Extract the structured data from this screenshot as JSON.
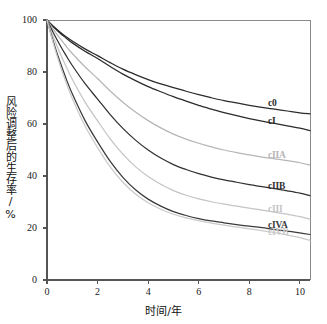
{
  "chart_data": {
    "type": "line",
    "title": "",
    "xlabel": "时间/年",
    "ylabel": "风险调整后的生存率/%",
    "xlim": [
      0,
      10.4
    ],
    "ylim": [
      0,
      100
    ],
    "xticks": [
      "0",
      "2",
      "4",
      "6",
      "8",
      "10"
    ],
    "xtick_values": [
      0,
      2,
      4,
      6,
      8,
      10
    ],
    "yticks": [
      "0",
      "20",
      "40",
      "60",
      "80",
      "100"
    ],
    "ytick_values": [
      0,
      20,
      40,
      60,
      80,
      100
    ],
    "grid": false,
    "legend_position": "inline-right",
    "x": [
      0,
      0.25,
      0.5,
      0.75,
      1,
      1.5,
      2,
      2.5,
      3,
      3.5,
      4,
      4.5,
      5,
      5.5,
      6,
      6.5,
      7,
      7.5,
      8,
      8.5,
      9,
      9.5,
      10,
      10.4
    ],
    "series": [
      {
        "name": "c0",
        "color": "#2b2b2b",
        "label": "c0",
        "values": [
          100,
          97.6,
          95.5,
          93.6,
          91.9,
          88.9,
          86.3,
          83.6,
          81.1,
          79.0,
          77.1,
          75.4,
          74.0,
          72.6,
          71.3,
          70.1,
          69.0,
          68.1,
          67.2,
          66.4,
          65.7,
          65.0,
          64.3,
          63.9
        ]
      },
      {
        "name": "cI",
        "color": "#2b2b2b",
        "label": "cI",
        "values": [
          100,
          97.4,
          95.1,
          93.1,
          91.2,
          88.0,
          85.2,
          82.1,
          79.2,
          76.7,
          74.4,
          72.4,
          70.5,
          68.8,
          67.2,
          65.7,
          64.4,
          63.2,
          62.1,
          61.1,
          60.2,
          59.3,
          58.4,
          57.4
        ]
      },
      {
        "name": "cIIA",
        "color": "#b6b6b6",
        "label": "cIIA",
        "values": [
          100,
          96.4,
          93.1,
          90.0,
          87.1,
          82.0,
          77.5,
          72.7,
          68.4,
          64.6,
          61.3,
          58.5,
          56.1,
          54.2,
          52.6,
          51.2,
          50.0,
          49.0,
          48.1,
          47.3,
          46.6,
          45.9,
          45.1,
          44.2
        ]
      },
      {
        "name": "cIIB",
        "color": "#303030",
        "label": "cIIB",
        "values": [
          100,
          95.1,
          90.6,
          86.4,
          82.5,
          75.6,
          69.6,
          63.6,
          58.3,
          53.8,
          50.0,
          46.9,
          44.4,
          42.5,
          40.9,
          39.6,
          38.5,
          37.6,
          36.7,
          35.9,
          35.1,
          34.3,
          33.4,
          32.4
        ]
      },
      {
        "name": "cIII",
        "color": "#c4c4c4",
        "label": "cIII",
        "values": [
          100,
          93.5,
          87.6,
          82.2,
          77.2,
          68.5,
          61.2,
          54.3,
          48.4,
          43.6,
          39.8,
          36.8,
          34.4,
          32.6,
          31.2,
          30.1,
          29.2,
          28.4,
          27.6,
          26.9,
          26.1,
          25.3,
          24.4,
          23.4
        ]
      },
      {
        "name": "cIVA",
        "color": "#3a3a3a",
        "label": "cIVA",
        "values": [
          100,
          91.7,
          84.3,
          77.6,
          71.6,
          61.4,
          53.1,
          45.6,
          39.5,
          34.7,
          31.1,
          28.4,
          26.3,
          24.8,
          23.6,
          22.7,
          22.0,
          21.3,
          20.7,
          20.1,
          19.4,
          18.8,
          18.1,
          17.5
        ]
      },
      {
        "name": "cIVB",
        "color": "#cacaca",
        "label": "cIVB",
        "values": [
          100,
          91.0,
          83.1,
          76.1,
          69.8,
          59.3,
          50.9,
          43.5,
          37.6,
          33.1,
          29.7,
          27.2,
          25.3,
          23.9,
          22.8,
          21.9,
          21.1,
          20.4,
          19.7,
          19.0,
          18.2,
          17.3,
          16.3,
          15.2
        ]
      }
    ]
  },
  "axis": {
    "x_title": "时间/年",
    "y_title": "风险调整后的生存率/%"
  },
  "labels": {
    "c0": "c0",
    "cI": "cI",
    "cIIA": "cIIA",
    "cIIB": "cIIB",
    "cIII": "cIII",
    "cIVA": "cIVA",
    "cIVB": "cIVB"
  },
  "colors": {
    "axis": "#555555",
    "dark_line": "#2b2b2b",
    "light_line": "#c0c0c0",
    "background": "#ffffff"
  }
}
